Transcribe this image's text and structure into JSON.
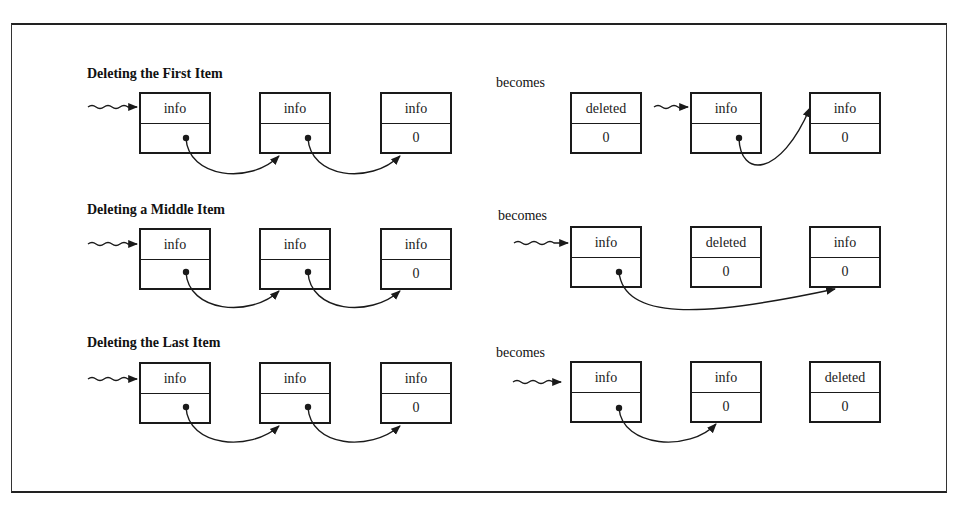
{
  "diagram": {
    "becomes_label": "becomes",
    "sections": [
      {
        "heading": "Deleting the First Item",
        "before": [
          {
            "info": "info",
            "next": ""
          },
          {
            "info": "info",
            "next": ""
          },
          {
            "info": "info",
            "next": "0"
          }
        ],
        "after": [
          {
            "info": "deleted",
            "next": "0"
          },
          {
            "info": "info",
            "next": ""
          },
          {
            "info": "info",
            "next": "0"
          }
        ]
      },
      {
        "heading": "Deleting a Middle Item",
        "before": [
          {
            "info": "info",
            "next": ""
          },
          {
            "info": "info",
            "next": ""
          },
          {
            "info": "info",
            "next": "0"
          }
        ],
        "after": [
          {
            "info": "info",
            "next": ""
          },
          {
            "info": "deleted",
            "next": "0"
          },
          {
            "info": "info",
            "next": "0"
          }
        ]
      },
      {
        "heading": "Deleting the Last Item",
        "before": [
          {
            "info": "info",
            "next": ""
          },
          {
            "info": "info",
            "next": ""
          },
          {
            "info": "info",
            "next": "0"
          }
        ],
        "after": [
          {
            "info": "info",
            "next": ""
          },
          {
            "info": "info",
            "next": "0"
          },
          {
            "info": "deleted",
            "next": "0"
          }
        ]
      }
    ]
  }
}
